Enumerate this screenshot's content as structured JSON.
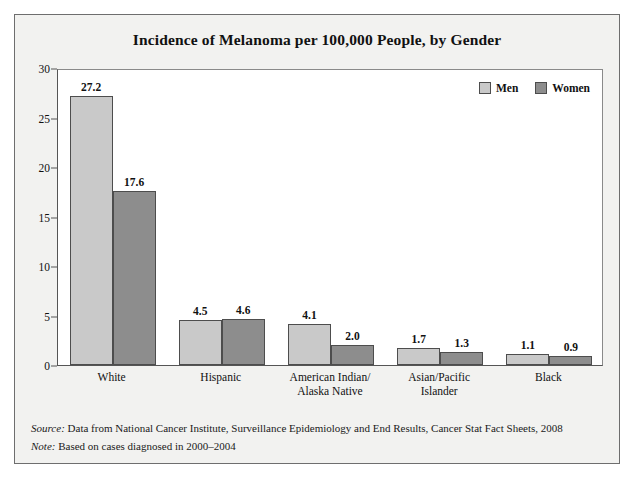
{
  "chart_data": {
    "type": "bar",
    "title": "Incidence of Melanoma per 100,000 People, by Gender",
    "xlabel": "",
    "ylabel": "",
    "ylim": [
      0,
      30
    ],
    "ytick_step": 5,
    "yticks": [
      "0",
      "5",
      "10",
      "15",
      "20",
      "25",
      "30"
    ],
    "grid": false,
    "legend_position": "top-right",
    "categories": [
      "White",
      "Hispanic",
      "American Indian/\nAlaska Native",
      "Asian/Pacific\nIslander",
      "Black"
    ],
    "category_lines": [
      [
        "White"
      ],
      [
        "Hispanic"
      ],
      [
        "American Indian/",
        "Alaska Native"
      ],
      [
        "Asian/Pacific",
        "Islander"
      ],
      [
        "Black"
      ]
    ],
    "series": [
      {
        "name": "Men",
        "color": "#c9c9c9",
        "values": [
          27.2,
          4.5,
          4.1,
          1.7,
          1.1
        ],
        "labels": [
          "27.2",
          "4.5",
          "4.1",
          "1.7",
          "1.1"
        ]
      },
      {
        "name": "Women",
        "color": "#8d8d8d",
        "values": [
          17.6,
          4.6,
          2.0,
          1.3,
          0.9
        ],
        "labels": [
          "17.6",
          "4.6",
          "2.0",
          "1.3",
          "0.9"
        ]
      }
    ]
  },
  "footnotes": [
    {
      "label": "Source:",
      "text": " Data from National Cancer Institute, Surveillance Epidemiology and End Results, Cancer Stat Fact Sheets, 2008"
    },
    {
      "label": "Note:",
      "text": " Based on cases diagnosed in 2000–2004"
    }
  ]
}
